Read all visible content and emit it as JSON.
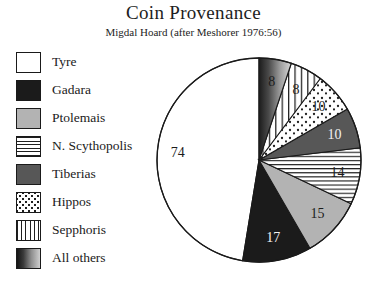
{
  "title": "Coin Provenance",
  "subtitle": "Migdal Hoard (after Meshorer 1976:56)",
  "legend": {
    "items": [
      {
        "label": "Tyre",
        "swatch": "white",
        "swatch_name": "swatch-tyre"
      },
      {
        "label": "Gadara",
        "swatch": "black",
        "swatch_name": "swatch-gadara"
      },
      {
        "label": "Ptolemais",
        "swatch": "ltgray",
        "swatch_name": "swatch-ptolemais"
      },
      {
        "label": "N. Scythopolis",
        "swatch": "hlines",
        "swatch_name": "swatch-n-scythopolis"
      },
      {
        "label": "Tiberias",
        "swatch": "dkgray",
        "swatch_name": "swatch-tiberias"
      },
      {
        "label": "Hippos",
        "swatch": "dots",
        "swatch_name": "swatch-hippos"
      },
      {
        "label": "Sepphoris",
        "swatch": "vlines",
        "swatch_name": "swatch-sepphoris"
      },
      {
        "label": "All others",
        "swatch": "grad",
        "swatch_name": "swatch-all-others"
      }
    ]
  },
  "chart_data": {
    "type": "pie",
    "title": "Coin Provenance",
    "subtitle": "Migdal Hoard (after Meshorer 1976:56)",
    "categories": [
      "Tyre",
      "Gadara",
      "Ptolemais",
      "N. Scythopolis",
      "Tiberias",
      "Hippos",
      "Sepphoris",
      "All others"
    ],
    "values": [
      74,
      17,
      15,
      14,
      10,
      10,
      8,
      8
    ],
    "total": 156,
    "labels_shown": [
      "74",
      "17",
      "15",
      "14",
      "10",
      "10",
      "8",
      "8"
    ],
    "start_angle_deg": 90,
    "direction": "counterclockwise",
    "legend_position": "left",
    "grid": false,
    "fills": {
      "Tyre": "white",
      "Gadara": "black",
      "Ptolemais": "light-gray",
      "N. Scythopolis": "horizontal-lines",
      "Tiberias": "dark-gray",
      "Hippos": "dots",
      "Sepphoris": "vertical-lines",
      "All others": "gradient"
    },
    "colors": {
      "white": "#ffffff",
      "black": "#1b1b1b",
      "light-gray": "#b3b3b3",
      "dark-gray": "#575757",
      "outline": "#1a1a1a"
    },
    "geometry": {
      "cx": 259,
      "cy": 160,
      "r": 102
    }
  }
}
